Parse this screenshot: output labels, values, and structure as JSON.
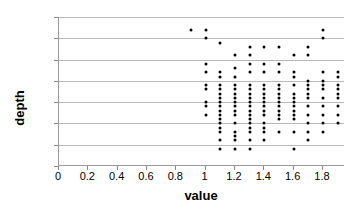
{
  "chart_data": {
    "type": "scatter",
    "title": "",
    "xlabel": "value",
    "ylabel": "depth",
    "xlim": [
      0,
      1.95
    ],
    "ylim": [
      0,
      35
    ],
    "grid": true,
    "grid_axis": "y",
    "legend": "none",
    "marker": "filled-circle",
    "marker_color": "#000000",
    "xticks": [
      "0",
      "0.2",
      "0.4",
      "0.6",
      "0.8",
      "1",
      "1.2",
      "1.4",
      "1.6",
      "1.8"
    ],
    "xtick_values": [
      0,
      0.2,
      0.4,
      0.6,
      0.8,
      1.0,
      1.2,
      1.4,
      1.6,
      1.8
    ],
    "yticks": [
      "0",
      "5",
      "10",
      "15",
      "20",
      "25",
      "30",
      "35"
    ],
    "ytick_values": [
      0,
      5,
      10,
      15,
      20,
      25,
      30,
      35
    ],
    "columns": [
      {
        "x": 0.9,
        "depths": [
          32
        ]
      },
      {
        "x": 1.0,
        "depths": [
          32,
          30,
          24,
          22,
          19,
          18,
          15,
          14,
          12
        ]
      },
      {
        "x": 1.1,
        "depths": [
          29,
          22,
          21,
          19,
          18,
          17,
          16,
          15,
          14,
          13,
          12,
          11,
          10,
          9,
          8,
          6,
          4
        ]
      },
      {
        "x": 1.2,
        "depths": [
          26,
          23,
          21,
          19,
          18,
          17,
          16,
          15,
          14,
          13,
          12,
          10,
          8,
          7,
          6,
          4
        ]
      },
      {
        "x": 1.3,
        "depths": [
          28,
          26,
          24,
          22,
          19,
          18,
          17,
          16,
          15,
          14,
          13,
          12,
          11,
          10,
          9,
          8,
          6,
          4
        ]
      },
      {
        "x": 1.4,
        "depths": [
          28,
          24,
          22,
          19,
          18,
          17,
          16,
          15,
          14,
          13,
          12,
          10,
          9,
          8,
          6
        ]
      },
      {
        "x": 1.5,
        "depths": [
          28,
          24,
          22,
          19,
          18,
          17,
          16,
          15,
          14,
          13,
          12,
          11,
          8
        ]
      },
      {
        "x": 1.6,
        "depths": [
          26,
          22,
          21,
          19,
          17,
          16,
          15,
          14,
          13,
          12,
          11,
          8,
          4
        ]
      },
      {
        "x": 1.7,
        "depths": [
          28,
          26,
          20,
          19,
          18,
          17,
          16,
          14,
          12,
          10,
          8,
          6
        ]
      },
      {
        "x": 1.8,
        "depths": [
          32,
          30,
          22,
          20,
          19,
          18,
          16,
          14,
          12,
          10,
          8
        ]
      },
      {
        "x": 1.9,
        "depths": [
          22,
          21,
          19,
          18,
          17,
          16,
          14,
          12,
          10
        ]
      }
    ]
  }
}
